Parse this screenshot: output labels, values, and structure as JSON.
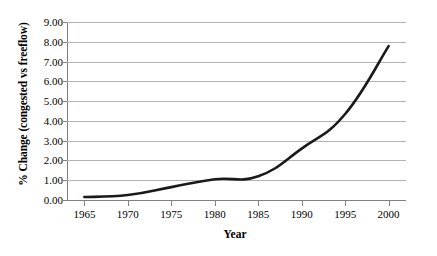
{
  "chart_data": {
    "type": "line",
    "title": "",
    "xlabel": "Year",
    "ylabel": "% Change (congested vs freeflow)",
    "x": [
      1965,
      1970,
      1975,
      1980,
      1985,
      1990,
      1995,
      2000
    ],
    "values": [
      0.15,
      0.25,
      0.65,
      1.05,
      1.2,
      2.6,
      4.35,
      7.78
    ],
    "series": [
      {
        "name": "% Change (congested vs freeflow)",
        "values": [
          0.15,
          0.25,
          0.65,
          1.05,
          1.2,
          2.6,
          4.35,
          7.78
        ]
      }
    ],
    "categories": [
      "1965",
      "1970",
      "1975",
      "1980",
      "1985",
      "1990",
      "1995",
      "2000"
    ],
    "x_tick_labels": [
      "1965",
      "1970",
      "1975",
      "1980",
      "1985",
      "1990",
      "1995",
      "2000"
    ],
    "y_tick_labels": [
      "0.00",
      "1.00",
      "2.00",
      "3.00",
      "4.00",
      "5.00",
      "6.00",
      "7.00",
      "8.00",
      "9.00"
    ],
    "y_tick_values": [
      0,
      1,
      2,
      3,
      4,
      5,
      6,
      7,
      8,
      9
    ],
    "xlim": [
      1963,
      2002
    ],
    "ylim": [
      0,
      9
    ],
    "grid": "horizontal",
    "legend": "none",
    "line_color": "#1a1a1a",
    "gridline_color": "#b3b3b3",
    "axis_color": "#808080",
    "background_color": "#ffffff"
  }
}
